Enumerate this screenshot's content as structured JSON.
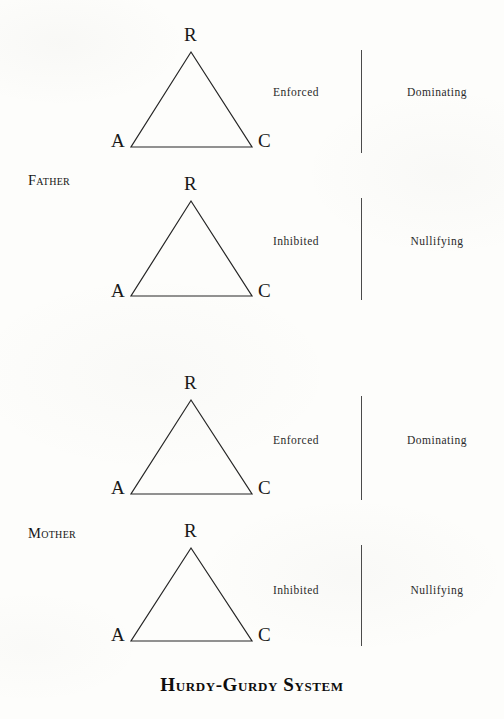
{
  "document": {
    "title": "Hurdy-Gurdy System",
    "background_color": "#fdfdfb",
    "ink_color": "#1a1a1a"
  },
  "title_caption": "Hurdy-Gurdy System",
  "vertex_labels": {
    "apex": "R",
    "bottom_left": "A",
    "bottom_right": "C"
  },
  "groups": [
    {
      "name": "Father",
      "label": "Father",
      "label_x": 28,
      "label_y": 172,
      "units": [
        {
          "index": 0,
          "triangle": {
            "apex_x": 191,
            "apex_y": 52,
            "left_x": 131,
            "right_x": 252,
            "base_y": 147
          },
          "vertices": {
            "apex": "R",
            "bottom_left": "A",
            "bottom_right": "C"
          },
          "inner_label": "Enforced",
          "outer_label": "Dominating",
          "inner_x": 296,
          "outer_x": 437,
          "label_y": 92,
          "divider_x": 361,
          "divider_top": 50,
          "divider_bottom": 153
        },
        {
          "index": 1,
          "triangle": {
            "apex_x": 191,
            "apex_y": 201,
            "left_x": 131,
            "right_x": 252,
            "base_y": 297
          },
          "vertices": {
            "apex": "R",
            "bottom_left": "A",
            "bottom_right": "C"
          },
          "inner_label": "Inhibited",
          "outer_label": "Nullifying",
          "inner_x": 296,
          "outer_x": 437,
          "label_y": 241,
          "divider_x": 361,
          "divider_top": 198,
          "divider_bottom": 300
        }
      ]
    },
    {
      "name": "Mother",
      "label": "Mother",
      "label_x": 28,
      "label_y": 525,
      "units": [
        {
          "index": 2,
          "triangle": {
            "apex_x": 191,
            "apex_y": 400,
            "left_x": 131,
            "right_x": 252,
            "base_y": 494
          },
          "vertices": {
            "apex": "R",
            "bottom_left": "A",
            "bottom_right": "C"
          },
          "inner_label": "Enforced",
          "outer_label": "Dominating",
          "inner_x": 296,
          "outer_x": 437,
          "label_y": 440,
          "divider_x": 361,
          "divider_top": 396,
          "divider_bottom": 500
        },
        {
          "index": 3,
          "triangle": {
            "apex_x": 191,
            "apex_y": 548,
            "left_x": 131,
            "right_x": 252,
            "base_y": 641
          },
          "vertices": {
            "apex": "R",
            "bottom_left": "A",
            "bottom_right": "C"
          },
          "inner_label": "Inhibited",
          "outer_label": "Nullifying",
          "inner_x": 296,
          "outer_x": 437,
          "label_y": 590,
          "divider_x": 361,
          "divider_top": 545,
          "divider_bottom": 646
        }
      ]
    }
  ],
  "title_y": 674
}
